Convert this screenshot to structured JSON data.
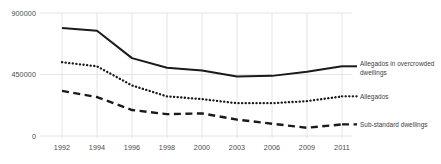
{
  "chart_data": {
    "type": "line",
    "title": "",
    "xlabel": "",
    "ylabel": "",
    "categories": [
      "1992",
      "1994",
      "1996",
      "1998",
      "2000",
      "2003",
      "2006",
      "2009",
      "2011"
    ],
    "ylim": [
      0,
      900000
    ],
    "yticks": [
      0,
      450000,
      900000
    ],
    "ytick_labels": [
      "0",
      "450000",
      "900000"
    ],
    "grid": true,
    "legend_position": "right-inline",
    "series": [
      {
        "name": "Allegados in overcrowded dwellings",
        "style": "solid",
        "color": "#1a1a1a",
        "values": [
          790000,
          770000,
          570000,
          500000,
          480000,
          435000,
          440000,
          470000,
          510000
        ]
      },
      {
        "name": "Allegados",
        "style": "dotted",
        "color": "#1a1a1a",
        "values": [
          540000,
          510000,
          370000,
          290000,
          270000,
          240000,
          240000,
          255000,
          290000
        ]
      },
      {
        "name": "Sub-standard dwellings",
        "style": "dashed",
        "color": "#1a1a1a",
        "values": [
          330000,
          285000,
          190000,
          160000,
          165000,
          120000,
          90000,
          60000,
          85000
        ]
      }
    ],
    "legend_labels": [
      [
        "Allegados in overcrowded",
        "dwellings"
      ],
      [
        "Allegados"
      ],
      [
        "Sub-standard dwellings"
      ]
    ],
    "colors": {
      "line": "#1a1a1a",
      "grid": "#e4e4e4",
      "text": "#4a4a4a",
      "background": "#ffffff"
    }
  }
}
